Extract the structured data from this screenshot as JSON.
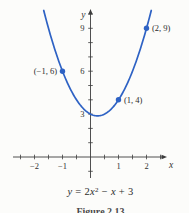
{
  "figure": {
    "figure_label": "Figure 2.13",
    "equation_segments": [
      {
        "t": "y",
        "style": "var"
      },
      {
        "t": " = 2"
      },
      {
        "t": "x",
        "style": "var"
      },
      {
        "t": "2",
        "style": "sup"
      },
      {
        "t": " − "
      },
      {
        "t": "x",
        "style": "var"
      },
      {
        "t": " + 3"
      }
    ]
  },
  "chart_data": {
    "type": "line",
    "equation": {
      "a": 2,
      "b": -1,
      "c": 3,
      "text": "y = 2x² − x + 3"
    },
    "xlabel": "x",
    "ylabel": "y",
    "x_axis_range": [
      -2.7,
      2.7
    ],
    "y_axis_range": [
      -1.3,
      10.4
    ],
    "x_domain_drawn": [
      -1.67,
      2.17
    ],
    "x_ticks_minor_step": 0.5,
    "y_ticks_step": 1,
    "x_ticks_labeled": [
      {
        "v": -2,
        "label": "−2"
      },
      {
        "v": -1,
        "label": "−1"
      },
      {
        "v": 1,
        "label": "1"
      },
      {
        "v": 2,
        "label": "2"
      }
    ],
    "y_ticks_labeled": [
      {
        "v": 3,
        "label": "3"
      },
      {
        "v": 6,
        "label": "6"
      },
      {
        "v": 9,
        "label": "9"
      }
    ],
    "points": [
      {
        "x": -1,
        "y": 6,
        "label": "(−1, 6)",
        "side": "left"
      },
      {
        "x": 1,
        "y": 4,
        "label": "(1, 4)",
        "side": "right"
      },
      {
        "x": 2,
        "y": 9,
        "label": "(2, 9)",
        "side": "right"
      }
    ],
    "legend": "none",
    "grid": false,
    "colors": {
      "curve": "#2e62c4",
      "axis": "#3c3c3c",
      "tick_text": "#333333",
      "point_label": "#2b2b2b"
    }
  }
}
